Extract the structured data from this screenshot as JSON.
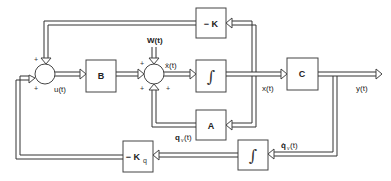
{
  "diagram": {
    "type": "control-system-block-diagram",
    "blocks": {
      "B": "B",
      "neg_K": "− K",
      "integrator_1": "∫",
      "C": "C",
      "A": "A",
      "integrator_2": "∫",
      "neg_Kq": "− K",
      "neg_Kq_sub": "q"
    },
    "signals": {
      "u": "u(t)",
      "W": "W(t)",
      "x_dot": "ẋ(t)",
      "x": "x(t)",
      "y": "y(t)",
      "qv": "q",
      "qv_sub": "v",
      "qv_arg": "(t)",
      "qv_dot": "q̇",
      "qv_dot_sub": "v",
      "qv_dot_arg": "(t)"
    },
    "signs": {
      "plus": "+"
    }
  }
}
